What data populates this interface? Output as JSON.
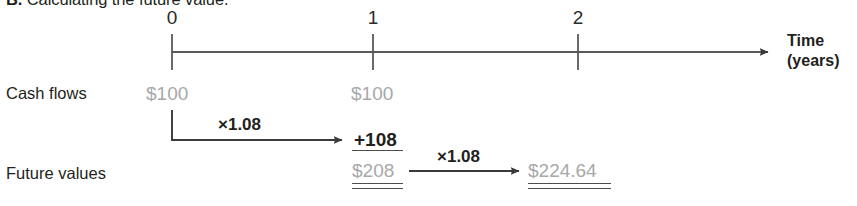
{
  "caption": {
    "letter": "B.",
    "text": " Calculating the future value."
  },
  "axis": {
    "caption_line1": "Time",
    "caption_line2": "(years)",
    "ticks": [
      {
        "label": "0",
        "x": 172
      },
      {
        "label": "1",
        "x": 373
      },
      {
        "label": "2",
        "x": 578
      }
    ]
  },
  "rows": {
    "cash_flows_label": "Cash flows",
    "future_values_label": "Future values"
  },
  "cash_flows": [
    {
      "value": "$100",
      "x": 146
    },
    {
      "value": "$100",
      "x": 351
    }
  ],
  "future_values": {
    "interest_year1": "+108",
    "total_year1": "$208",
    "total_year2": "$224.64"
  },
  "multipliers": [
    {
      "label": "×1.08",
      "x": 218,
      "y": 116
    },
    {
      "label": "×1.08",
      "x": 437,
      "y": 148
    }
  ],
  "colors": {
    "ink": "#231f20",
    "gray_value": "#a6a8ab",
    "rule": "#4d4d4d",
    "axis": "#58595b",
    "background": "#ffffff"
  }
}
